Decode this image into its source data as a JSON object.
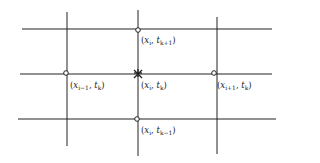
{
  "diagram": {
    "type": "finite-difference-stencil",
    "colors": {
      "line": "#222222",
      "background": "#ffffff"
    },
    "grid": {
      "horizontal_lines": [
        {
          "name": "t-k-plus-1",
          "y": 29,
          "x1": 22,
          "x2": 272
        },
        {
          "name": "t-k",
          "y": 74,
          "x1": 20,
          "x2": 272
        },
        {
          "name": "t-k-minus-1",
          "y": 119,
          "x1": 18,
          "x2": 276
        }
      ],
      "vertical_lines": [
        {
          "name": "x-i-minus-1",
          "x": 67,
          "y1": 12,
          "y2": 146
        },
        {
          "name": "x-i",
          "x": 138,
          "y1": 10,
          "y2": 156
        },
        {
          "name": "x-i-plus-1",
          "x": 217,
          "y1": 17,
          "y2": 154
        }
      ]
    },
    "nodes": [
      {
        "name": "node-top",
        "marker": "circle",
        "cx": 138,
        "cy": 30,
        "label": {
          "x": "x",
          "x_sub": "i",
          "t": "t",
          "t_sub": "k+1"
        }
      },
      {
        "name": "node-left",
        "marker": "circle",
        "cx": 66,
        "cy": 73,
        "label": {
          "x": "x",
          "x_sub": "i−1",
          "t": "t",
          "t_sub": "k"
        }
      },
      {
        "name": "node-center",
        "marker": "star",
        "cx": 138,
        "cy": 73,
        "label": {
          "x": "x",
          "x_sub": "i",
          "t": "t",
          "t_sub": "k"
        }
      },
      {
        "name": "node-right",
        "marker": "circle",
        "cx": 214,
        "cy": 73,
        "label": {
          "x": "x",
          "x_sub": "i+1",
          "t": "t",
          "t_sub": "k"
        }
      },
      {
        "name": "node-bottom",
        "marker": "circle",
        "cx": 137,
        "cy": 119,
        "label": {
          "x": "x",
          "x_sub": "i",
          "t": "t",
          "t_sub": "k−1"
        }
      }
    ],
    "punctuation": {
      "open": "(",
      "sep": ", ",
      "close": ")"
    }
  }
}
